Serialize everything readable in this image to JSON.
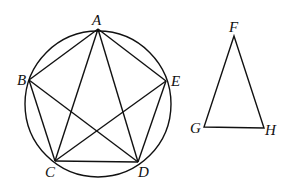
{
  "figure": {
    "circle": {
      "cx": 98,
      "cy": 104,
      "r": 73
    },
    "pentagon_points": {
      "A": {
        "label": "A",
        "x": 98,
        "y": 29
      },
      "B": {
        "label": "B",
        "x": 29,
        "y": 80
      },
      "C": {
        "label": "C",
        "x": 55,
        "y": 161
      },
      "D": {
        "label": "D",
        "x": 138,
        "y": 162
      },
      "E": {
        "label": "E",
        "x": 166,
        "y": 81
      }
    },
    "triangle_points": {
      "F": {
        "label": "F",
        "x": 234,
        "y": 36
      },
      "G": {
        "label": "G",
        "x": 204,
        "y": 127
      },
      "H": {
        "label": "H",
        "x": 264,
        "y": 128
      }
    },
    "segments": [
      "AB",
      "BC",
      "CD",
      "DE",
      "EA",
      "AC",
      "AD",
      "BD",
      "BE",
      "CE",
      "FG",
      "GH",
      "HF"
    ]
  }
}
